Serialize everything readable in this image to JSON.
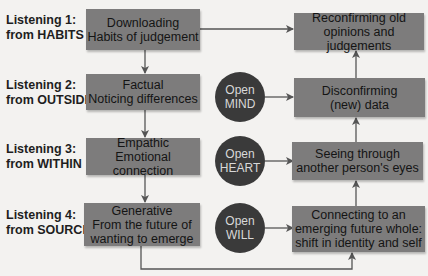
{
  "levels": [
    {
      "label_line1": "Listening 1:",
      "label_line2": "from HABITS",
      "left_box": {
        "line1": "Downloading",
        "line2": "Habits of judgement"
      },
      "right_box": {
        "line1": "Reconfirming old",
        "line2": "opinions and judgements"
      }
    },
    {
      "label_line1": "Listening 2:",
      "label_line2": "from OUTSIDE",
      "left_box": {
        "line1": "Factual",
        "line2": "Noticing differences"
      },
      "circle": {
        "line1": "Open",
        "line2": "MIND"
      },
      "right_box": {
        "line1": "Disconfirming",
        "line2": "(new) data"
      }
    },
    {
      "label_line1": "Listening 3:",
      "label_line2": "from WITHIN",
      "left_box": {
        "line1": "Empathic",
        "line2": "Emotional connection"
      },
      "circle": {
        "line1": "Open",
        "line2": "HEART"
      },
      "right_box": {
        "line1": "Seeing through",
        "line2": "another person's eyes"
      }
    },
    {
      "label_line1": "Listening 4:",
      "label_line2": "from SOURCE",
      "left_box": {
        "line1": "Generative",
        "line2": "From the future of",
        "line3": "wanting to emerge"
      },
      "circle": {
        "line1": "Open",
        "line2": "WILL"
      },
      "right_box": {
        "line1": "Connecting to an",
        "line2": "emerging future whole:",
        "line3": "shift in identity and self"
      }
    }
  ],
  "colors": {
    "background": "#f3f2f0",
    "box_fill": "#7d7c7c",
    "circle_fill": "#3a3a3a",
    "arrow": "#555555"
  }
}
